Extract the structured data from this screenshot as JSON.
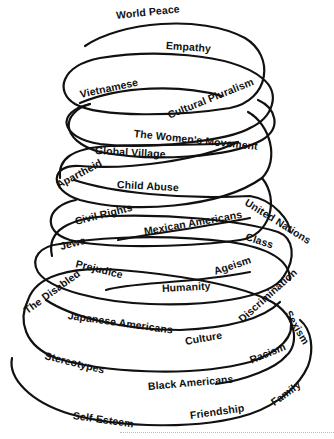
{
  "diagram": {
    "type": "spiral",
    "stroke_color": "#111111",
    "background": "#ffffff",
    "labels": [
      {
        "id": "world-peace",
        "text": "World Peace",
        "x": 116,
        "y": 16,
        "rot": -6
      },
      {
        "id": "empathy",
        "text": "Empathy",
        "x": 166,
        "y": 45,
        "rot": 4
      },
      {
        "id": "vietnamese",
        "text": "Vietnamese",
        "x": 80,
        "y": 94,
        "rot": -12
      },
      {
        "id": "cultural-pluralism",
        "text": "Cultural Pluralism",
        "x": 168,
        "y": 114,
        "rot": -22
      },
      {
        "id": "womens-movement",
        "text": "The Women's Movement",
        "x": 134,
        "y": 135,
        "rot": 6
      },
      {
        "id": "global-village",
        "text": "Global Village",
        "x": 95,
        "y": 152,
        "rot": 3
      },
      {
        "id": "apartheid",
        "text": "Apartheid",
        "x": 57,
        "y": 181,
        "rot": -28
      },
      {
        "id": "child-abuse",
        "text": "Child Abuse",
        "x": 117,
        "y": 186,
        "rot": 3
      },
      {
        "id": "united-nations",
        "text": "United Nations",
        "x": 246,
        "y": 200,
        "rot": 32
      },
      {
        "id": "civil-rights",
        "text": "Civil Rights",
        "x": 75,
        "y": 220,
        "rot": -14
      },
      {
        "id": "mexican-americans",
        "text": "Mexican Americans",
        "x": 144,
        "y": 232,
        "rot": -10
      },
      {
        "id": "jews",
        "text": "Jews",
        "x": 60,
        "y": 243,
        "rot": -14
      },
      {
        "id": "class",
        "text": "Class",
        "x": 246,
        "y": 237,
        "rot": 18
      },
      {
        "id": "prejudice",
        "text": "Prejudice",
        "x": 76,
        "y": 265,
        "rot": 14
      },
      {
        "id": "ageism",
        "text": "Ageism",
        "x": 214,
        "y": 268,
        "rot": -18
      },
      {
        "id": "the-disabled",
        "text": "The Disabled",
        "x": 25,
        "y": 306,
        "rot": -36
      },
      {
        "id": "humanity",
        "text": "Humanity",
        "x": 162,
        "y": 288,
        "rot": -3
      },
      {
        "id": "discrimination",
        "text": "Discrimination",
        "x": 240,
        "y": 312,
        "rot": -42
      },
      {
        "id": "japanese-americans",
        "text": "Japanese Americans",
        "x": 68,
        "y": 316,
        "rot": 8
      },
      {
        "id": "sexism",
        "text": "Sexism",
        "x": 288,
        "y": 306,
        "rot": 60
      },
      {
        "id": "culture",
        "text": "Culture",
        "x": 185,
        "y": 340,
        "rot": -10
      },
      {
        "id": "stereotypes",
        "text": "Stereotypes",
        "x": 45,
        "y": 354,
        "rot": 14
      },
      {
        "id": "racism",
        "text": "Racism",
        "x": 250,
        "y": 355,
        "rot": -22
      },
      {
        "id": "black-americans",
        "text": "Black Americans",
        "x": 148,
        "y": 385,
        "rot": -5
      },
      {
        "id": "family",
        "text": "Family",
        "x": 272,
        "y": 396,
        "rot": -36
      },
      {
        "id": "self-esteem",
        "text": "Self-Esteem",
        "x": 73,
        "y": 415,
        "rot": 8
      },
      {
        "id": "friendship",
        "text": "Friendship",
        "x": 190,
        "y": 414,
        "rot": -8
      }
    ]
  }
}
